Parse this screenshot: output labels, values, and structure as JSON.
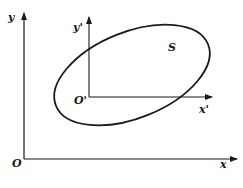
{
  "diagram": {
    "global_axes": {
      "origin_label": "O",
      "x_label": "x",
      "y_label": "y"
    },
    "local_axes": {
      "origin_label": "O'",
      "x_label": "x'",
      "y_label": "y'"
    },
    "region_label": "S",
    "colors": {
      "stroke": "#1a1a1a",
      "background": "#ffffff"
    }
  }
}
